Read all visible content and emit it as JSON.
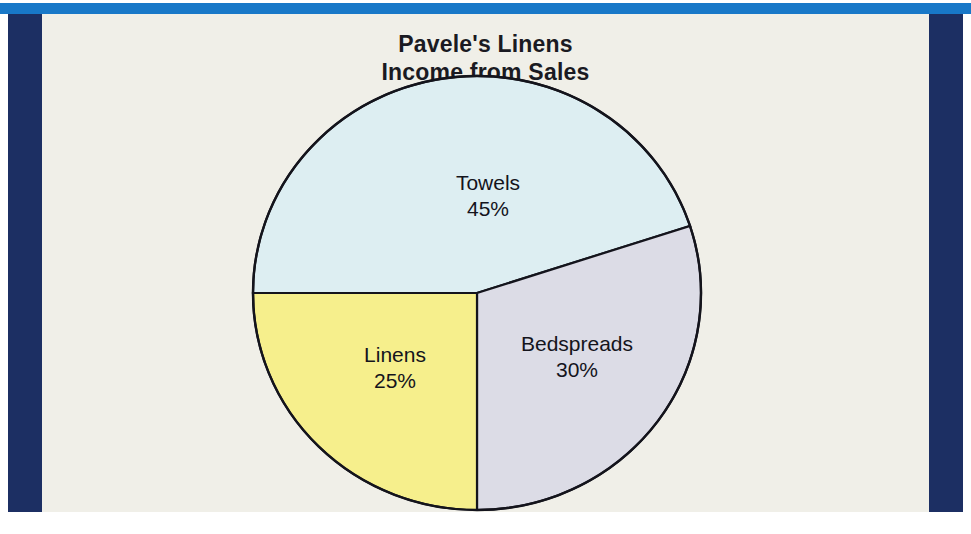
{
  "figure": {
    "title_line1": "Pavele's Linens",
    "title_line2": "Income from Sales",
    "background_color": "#f0efe8",
    "band_color": "#1c2f63",
    "top_rule_color": "#1878c8"
  },
  "chart_data": {
    "type": "pie",
    "title": "Pavele's Linens Income from Sales",
    "categories": [
      "Towels",
      "Bedspreads",
      "Linens"
    ],
    "values": [
      45,
      30,
      25
    ],
    "value_labels": [
      "45%",
      "30%",
      "25%"
    ],
    "units": "percent",
    "total": 100,
    "start_angle_deg": 180,
    "direction": "clockwise",
    "colors": [
      "#ddeef2",
      "#dcdce6",
      "#f6ef8c"
    ],
    "outline_color": "#14141c",
    "labels_inside": true,
    "legend": "none",
    "grid": false,
    "slices": [
      {
        "name": "Towels",
        "value": 45,
        "label": "Towels",
        "pct_label": "45%",
        "color": "#ddeef2"
      },
      {
        "name": "Bedspreads",
        "value": 30,
        "label": "Bedspreads",
        "pct_label": "30%",
        "color": "#dcdce6"
      },
      {
        "name": "Linens",
        "value": 25,
        "label": "Linens",
        "pct_label": "25%",
        "color": "#f6ef8c"
      }
    ]
  }
}
